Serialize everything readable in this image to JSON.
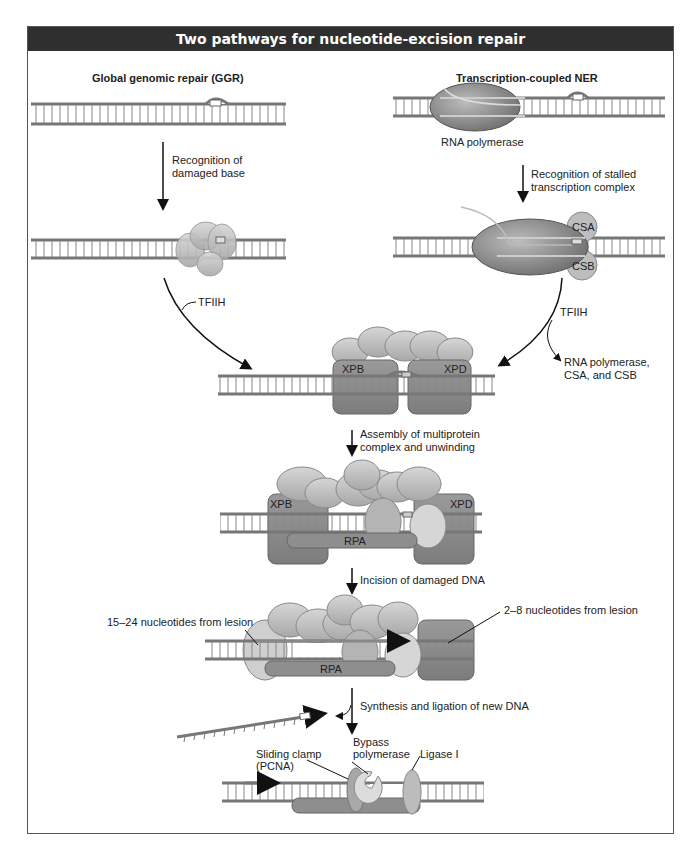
{
  "title": "Two pathways for nucleotide-excision repair",
  "pathways": {
    "left": {
      "title": "Global genomic repair (GGR)",
      "step1": [
        "Recognition of",
        "damaged base"
      ],
      "factor": "TFIIH"
    },
    "right": {
      "title": "Transcription-coupled NER",
      "polymerase_label": "RNA polymerase",
      "step1": [
        "Recognition of stalled",
        "transcription complex"
      ],
      "proteins": [
        "CSA",
        "CSB"
      ],
      "factor": "TFIIH",
      "released": [
        "RNA polymerase,",
        "CSA, and CSB"
      ]
    }
  },
  "steps": {
    "merge": {
      "proteins": [
        "XPB",
        "XPD"
      ]
    },
    "assembly": {
      "label": [
        "Assembly of multiprotein",
        "complex and unwinding"
      ],
      "proteins": [
        "XPB",
        "XPD",
        "RPA"
      ]
    },
    "incision": {
      "label": "Incision of damaged DNA",
      "left_note": "15–24 nucleotides from lesion",
      "right_note": "2–8 nucleotides from lesion",
      "proteins": [
        "RPA"
      ]
    },
    "synthesis": {
      "label": "Synthesis and ligation of new DNA",
      "labels": {
        "clamp": [
          "Sliding clamp",
          "(PCNA)"
        ],
        "polymerase": [
          "Bypass",
          "polymerase"
        ],
        "ligase": "Ligase I"
      }
    }
  },
  "colors": {
    "header_bg": "#2f2f2f",
    "strand": "#7a7a7a",
    "protein_light": "#c9c9c9",
    "protein_mid": "#a9a9a9",
    "protein_dark": "#7e7e7e",
    "polymerase": "#8a8a8a"
  }
}
